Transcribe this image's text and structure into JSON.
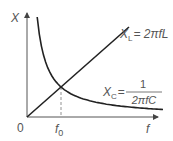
{
  "chart_data": {
    "type": "line",
    "title": "",
    "xlabel": "f",
    "ylabel": "X",
    "origin_label": "0",
    "x_ticks": [
      {
        "label_main": "f",
        "label_sub": "0",
        "x": 1
      }
    ],
    "xlim": [
      0,
      4
    ],
    "ylim": [
      0,
      3.6
    ],
    "grid": false,
    "series": [
      {
        "name": "X_L",
        "label_main": "X",
        "label_sub": "L",
        "formula": "= 2πfL",
        "kind": "linear",
        "points": [
          [
            0,
            0
          ],
          [
            1,
            1
          ],
          [
            3,
            3
          ]
        ]
      },
      {
        "name": "X_C",
        "label_main": "X",
        "label_sub": "C",
        "formula_prefix": "=",
        "formula_num": "1",
        "formula_den": "2πfC",
        "kind": "inverse",
        "points": [
          [
            0.3,
            3.33
          ],
          [
            0.5,
            2
          ],
          [
            1,
            1
          ],
          [
            2,
            0.5
          ],
          [
            3,
            0.33
          ],
          [
            4,
            0.25
          ]
        ]
      }
    ],
    "annotations": [
      {
        "type": "dashed-vertical",
        "at_x": 1,
        "label": "f0"
      }
    ]
  }
}
